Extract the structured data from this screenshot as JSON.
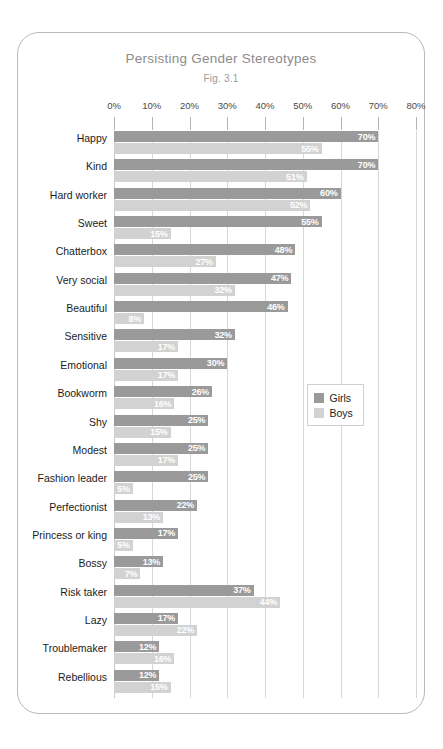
{
  "chart_data": {
    "type": "bar",
    "orientation": "horizontal",
    "title": "Persisting Gender Stereotypes",
    "subtitle": "Fig. 3.1",
    "xlabel": "",
    "ylabel": "",
    "xlim": [
      0,
      80
    ],
    "grid": true,
    "legend_position": "middle-right",
    "tick_labels": [
      "0%",
      "10%",
      "20%",
      "30%",
      "40%",
      "50%",
      "60%",
      "70%",
      "80%"
    ],
    "tick_values": [
      0,
      10,
      20,
      30,
      40,
      50,
      60,
      70,
      80
    ],
    "categories": [
      "Happy",
      "Kind",
      "Hard worker",
      "Sweet",
      "Chatterbox",
      "Very social",
      "Beautiful",
      "Sensitive",
      "Emotional",
      "Bookworm",
      "Shy",
      "Modest",
      "Fashion leader",
      "Perfectionist",
      "Princess or king",
      "Bossy",
      "Risk taker",
      "Lazy",
      "Troublemaker",
      "Rebellious"
    ],
    "series": [
      {
        "name": "Girls",
        "color": "#9a9a9a",
        "values": [
          70,
          70,
          60,
          55,
          48,
          47,
          46,
          32,
          30,
          26,
          25,
          25,
          25,
          22,
          17,
          13,
          37,
          17,
          12,
          12
        ],
        "labels": [
          "70%",
          "70%",
          "60%",
          "55%",
          "48%",
          "47%",
          "46%",
          "32%",
          "30%",
          "26%",
          "25%",
          "25%",
          "25%",
          "22%",
          "17%",
          "13%",
          "37%",
          "17%",
          "12%",
          "12%"
        ]
      },
      {
        "name": "Boys",
        "color": "#d2d2d2",
        "values": [
          55,
          51,
          52,
          15,
          27,
          32,
          8,
          17,
          17,
          16,
          15,
          17,
          5,
          13,
          5,
          7,
          44,
          22,
          16,
          15
        ],
        "labels": [
          "55%",
          "51%",
          "52%",
          "15%",
          "27%",
          "32%",
          "8%",
          "17%",
          "17%",
          "16%",
          "15%",
          "17%",
          "5%",
          "13%",
          "5%",
          "7%",
          "44%",
          "22%",
          "16%",
          "15%"
        ]
      }
    ]
  },
  "legend": {
    "entries": [
      {
        "label": "Girls",
        "color": "#9a9a9a"
      },
      {
        "label": "Boys",
        "color": "#d2d2d2"
      }
    ]
  }
}
